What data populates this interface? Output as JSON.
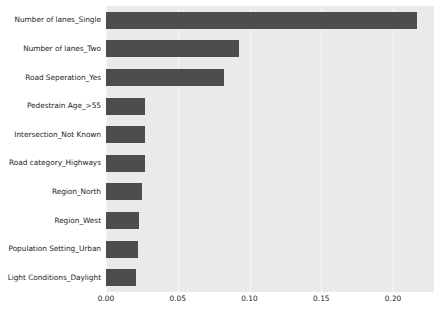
{
  "chart_data": {
    "type": "bar",
    "orientation": "horizontal",
    "title": "",
    "xlabel": "",
    "ylabel": "",
    "categories": [
      "Number of lanes_Single",
      "Number of lanes_Two",
      "Road Seperation_Yes",
      "Pedestrain Age_>55",
      "Intersection_Not Known",
      "Road category_Highways",
      "Region_North",
      "Region_West",
      "Population Setting_Urban",
      "Light Conditions_Daylight"
    ],
    "values": [
      0.217,
      0.093,
      0.082,
      0.0275,
      0.0275,
      0.027,
      0.025,
      0.023,
      0.022,
      0.021
    ],
    "xlim": [
      0.0,
      0.2285
    ],
    "ylim_note": "categorical, descending importance",
    "xticks": [
      0.0,
      0.05,
      0.1,
      0.15,
      0.2
    ],
    "xticklabels": [
      "0.00",
      "0.05",
      "0.10",
      "0.15",
      "0.20"
    ],
    "grid": "vertical-white-on-gray",
    "legend": null,
    "legend_position": "none",
    "bar_color": "#4d4d4d",
    "plot_background": "#eaeaea",
    "figure_background": "#ffffff",
    "gridline_color": "#f7f7f7",
    "tick_label_color": "#262626"
  }
}
